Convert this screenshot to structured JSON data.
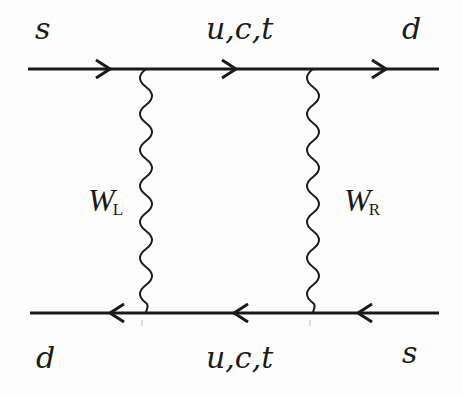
{
  "diagram": {
    "type": "feynman-box-diagram",
    "top_line": {
      "incoming_label": "s",
      "internal_label": "u,c,t",
      "outgoing_label": "d",
      "arrow_direction": "right"
    },
    "bottom_line": {
      "incoming_label": "s",
      "internal_label": "u,c,t",
      "outgoing_label": "d",
      "arrow_direction": "left"
    },
    "bosons": [
      {
        "label": "W",
        "subscript": "L"
      },
      {
        "label": "W",
        "subscript": "R"
      }
    ],
    "colors": {
      "line": "#1a1a1a",
      "background": "#fdfdfd"
    }
  }
}
